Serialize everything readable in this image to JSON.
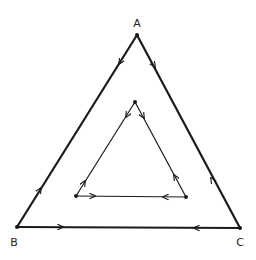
{
  "diagram": {
    "type": "nested-triangle-flow",
    "vertex_labels": {
      "a": "A",
      "b": "B",
      "c": "C"
    },
    "outer_triangle": {
      "vertices": [
        "A",
        "B",
        "C"
      ],
      "edges": [
        {
          "from": "A",
          "to": "B",
          "arrows": [
            "toward B near A",
            "toward A near B"
          ]
        },
        {
          "from": "A",
          "to": "C",
          "arrows": [
            "toward C near A",
            "toward A near C"
          ]
        },
        {
          "from": "B",
          "to": "C",
          "arrows": [
            "toward C near B",
            "toward B near C"
          ]
        }
      ]
    },
    "inner_triangle": {
      "vertices": [
        "top",
        "bottom-left",
        "bottom-right"
      ],
      "arrows": "outward from each vertex along both adjacent edges"
    },
    "colors": {
      "line": "#1a1a1a",
      "background": "#ffffff"
    }
  }
}
